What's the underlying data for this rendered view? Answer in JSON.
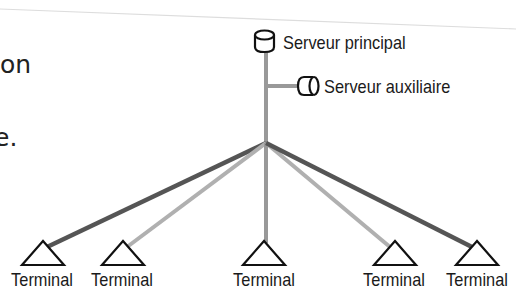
{
  "slide_fragments": {
    "line1_tail": "on",
    "line2_tail": "e."
  },
  "diagram": {
    "primary_server": {
      "label": "Serveur principal",
      "icon": "database-cylinder-icon"
    },
    "auxiliary_server": {
      "label": "Serveur auxiliaire",
      "icon": "horizontal-cylinder-icon"
    },
    "terminals": [
      {
        "label": "Terminal",
        "link_style": "dark"
      },
      {
        "label": "Terminal",
        "link_style": "light"
      },
      {
        "label": "Terminal",
        "link_style": "medium"
      },
      {
        "label": "Terminal",
        "link_style": "light"
      },
      {
        "label": "Terminal",
        "link_style": "dark"
      }
    ],
    "colors": {
      "dark_link": "#555555",
      "light_link": "#b0b0b0",
      "medium_link": "#999999",
      "outline": "#111111"
    }
  }
}
